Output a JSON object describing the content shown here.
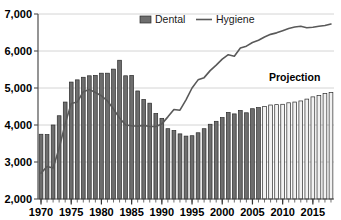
{
  "chart_data": {
    "type": "bar",
    "title": "",
    "subtitle": "",
    "xlabel": "",
    "ylabel": "",
    "ylim": [
      2000,
      7000
    ],
    "ytick_step": 1000,
    "ytick_labels": [
      "2,000",
      "3,000",
      "4,000",
      "5,000",
      "6,000",
      "7,000"
    ],
    "ytick_values": [
      2000,
      3000,
      4000,
      5000,
      6000,
      7000
    ],
    "xlim": [
      1970,
      2018
    ],
    "xtick_labels": [
      "1970",
      "1975",
      "1980",
      "1985",
      "1990",
      "1995",
      "2000",
      "2005",
      "2010",
      "2015"
    ],
    "xtick_values": [
      1970,
      1975,
      1980,
      1985,
      1990,
      1995,
      2000,
      2005,
      2010,
      2015
    ],
    "grid": "horizontal",
    "legend_position": "top-center",
    "legend": [
      {
        "name": "Dental",
        "marker": "bar-swatch",
        "color": "#6e6e6e"
      },
      {
        "name": "Hygiene",
        "marker": "line",
        "color": "#595959"
      }
    ],
    "annotations": [
      {
        "text": "Projection",
        "x": 2012,
        "y": 5300
      }
    ],
    "projection_start_year": 2007,
    "categories": [
      1970,
      1971,
      1972,
      1973,
      1974,
      1975,
      1976,
      1977,
      1978,
      1979,
      1980,
      1981,
      1982,
      1983,
      1984,
      1985,
      1986,
      1987,
      1988,
      1989,
      1990,
      1991,
      1992,
      1993,
      1994,
      1995,
      1996,
      1997,
      1998,
      1999,
      2000,
      2001,
      2002,
      2003,
      2004,
      2005,
      2006,
      2007,
      2008,
      2009,
      2010,
      2011,
      2012,
      2013,
      2014,
      2015,
      2016,
      2017,
      2018
    ],
    "series": [
      {
        "name": "Dental",
        "type": "bar",
        "color": "#6e6e6e",
        "projection_color": "#f2f2f2",
        "values": [
          3750,
          3740,
          4000,
          4250,
          4620,
          5160,
          5220,
          5290,
          5330,
          5340,
          5400,
          5400,
          5510,
          5750,
          5330,
          5340,
          4920,
          4690,
          4590,
          4310,
          4180,
          3900,
          3850,
          3760,
          3700,
          3710,
          3790,
          3900,
          4020,
          4100,
          4200,
          4340,
          4300,
          4390,
          4330,
          4440,
          4470,
          4500,
          4540,
          4550,
          4560,
          4600,
          4620,
          4650,
          4700,
          4760,
          4800,
          4850,
          4880
        ]
      },
      {
        "name": "Hygiene",
        "type": "line",
        "color": "#595959",
        "values": [
          2700,
          2880,
          2840,
          3370,
          4030,
          4580,
          4620,
          4900,
          4960,
          4880,
          4790,
          4650,
          4430,
          4190,
          4000,
          3980,
          3970,
          3990,
          3960,
          3960,
          4030,
          4220,
          4420,
          4400,
          4680,
          5000,
          5220,
          5280,
          5470,
          5620,
          5780,
          5900,
          5860,
          6080,
          6130,
          6230,
          6290,
          6380,
          6450,
          6490,
          6550,
          6610,
          6650,
          6670,
          6630,
          6640,
          6670,
          6690,
          6730
        ]
      }
    ]
  }
}
